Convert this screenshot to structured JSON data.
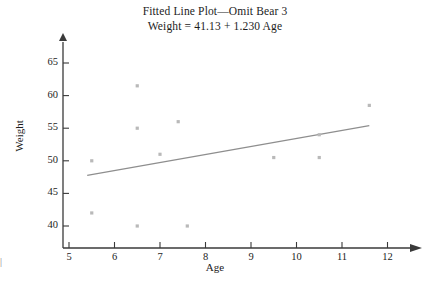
{
  "figure": {
    "title_line1": "Fitted Line Plot—Omit Bear 3",
    "title_line2": "Weight = 41.13 + 1.230 Age",
    "edge_artifact": "|"
  },
  "chart_data": {
    "type": "scatter",
    "title": "Fitted Line Plot—Omit Bear 3",
    "subtitle": "Weight = 41.13 + 1.230 Age",
    "xlabel": "Age",
    "ylabel": "Weight",
    "xlim": [
      4.6,
      12.4
    ],
    "ylim": [
      37.5,
      66.5
    ],
    "xticks": [
      5,
      6,
      7,
      8,
      9,
      10,
      11,
      12
    ],
    "xtick_labels": [
      "5",
      "6",
      "7",
      "8",
      "9",
      "10",
      "11",
      "12"
    ],
    "yticks": [
      40,
      45,
      50,
      55,
      60,
      65
    ],
    "ytick_labels": [
      "40",
      "45",
      "50",
      "55",
      "60",
      "65"
    ],
    "grid": false,
    "legend": false,
    "marker_color": "#b9b9b9",
    "line_color": "#8e8e8e",
    "axis_color": "#3a3a3a",
    "x": [
      5.5,
      5.5,
      6.5,
      6.5,
      6.5,
      7.0,
      7.4,
      7.6,
      9.5,
      10.5,
      10.5,
      11.6
    ],
    "y": [
      50.0,
      42.0,
      61.5,
      55.0,
      40.0,
      51.0,
      56.0,
      40.0,
      50.5,
      54.0,
      50.5,
      58.5
    ],
    "points": [
      {
        "age": 5.5,
        "weight": 50.0
      },
      {
        "age": 5.5,
        "weight": 42.0
      },
      {
        "age": 6.5,
        "weight": 61.5
      },
      {
        "age": 6.5,
        "weight": 55.0
      },
      {
        "age": 6.5,
        "weight": 40.0
      },
      {
        "age": 7.0,
        "weight": 51.0
      },
      {
        "age": 7.4,
        "weight": 56.0
      },
      {
        "age": 7.6,
        "weight": 40.0
      },
      {
        "age": 9.5,
        "weight": 50.5
      },
      {
        "age": 10.5,
        "weight": 54.0
      },
      {
        "age": 10.5,
        "weight": 50.5
      },
      {
        "age": 11.6,
        "weight": 58.5
      }
    ],
    "fit_line": {
      "equation": "Weight = 41.13 + 1.230 Age",
      "intercept": 41.13,
      "slope": 1.23,
      "x_start": 5.4,
      "x_end": 11.6,
      "y_start": 47.77,
      "y_end": 55.4
    }
  }
}
